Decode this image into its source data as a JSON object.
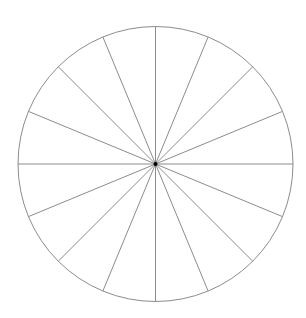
{
  "diagram": {
    "type": "segmented-circle",
    "center": {
      "x": 155.5,
      "y": 164
    },
    "radius": 137.5,
    "segments": 16,
    "start_angle_deg": 0,
    "stroke_color": "#8c8c8c",
    "stroke_width": 1,
    "outline_color": "#8c8c8c",
    "center_dot_color": "#000000",
    "center_dot_radius": 2,
    "background": "#ffffff"
  }
}
